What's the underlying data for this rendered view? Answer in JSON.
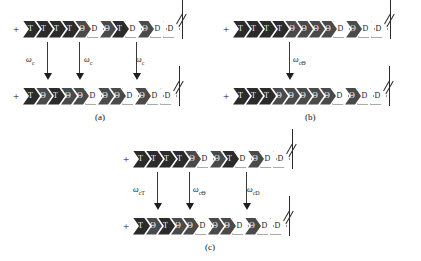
{
  "figure": {
    "symbols": {
      "T": "T",
      "Theta": "Θ",
      "D": "D",
      "plus_end": "+",
      "omega": "ω"
    },
    "panels": [
      {
        "id": "a",
        "caption": "(a)",
        "top_strand": {
          "plus_label": "+",
          "segments": [
            "T",
            "T",
            "T",
            "T",
            "Θ",
            "D",
            "Θ",
            "T",
            "D",
            "Θ",
            "D",
            "D"
          ],
          "states": [
            "T",
            "T",
            "T",
            "T",
            "O",
            "D",
            "O",
            "T",
            "D",
            "O",
            "D",
            "D"
          ]
        },
        "bottom_strand": {
          "plus_label": "+",
          "segments": [
            "T",
            "Θ",
            "T",
            "Θ",
            "Θ",
            "D",
            "Θ",
            "Θ",
            "D",
            "Θ",
            "D",
            "D"
          ],
          "states": [
            "T",
            "O",
            "T",
            "O",
            "O",
            "D",
            "O",
            "O",
            "D",
            "O",
            "D",
            "D"
          ]
        },
        "transitions": [
          {
            "label_base": "ω",
            "label_sub": "c"
          },
          {
            "label_base": "ω",
            "label_sub": "c"
          },
          {
            "label_base": "ω",
            "label_sub": "c"
          }
        ]
      },
      {
        "id": "b",
        "caption": "(b)",
        "top_strand": {
          "plus_label": "+",
          "segments": [
            "T",
            "T",
            "T",
            "T",
            "Θ",
            "Θ",
            "Θ",
            "Θ",
            "D",
            "Θ",
            "D",
            "D"
          ],
          "states": [
            "T",
            "T",
            "T",
            "T",
            "O",
            "O",
            "O",
            "O",
            "D",
            "O",
            "D",
            "D"
          ]
        },
        "bottom_strand": {
          "plus_label": "+",
          "segments": [
            "T",
            "T",
            "T",
            "Θ",
            "Θ",
            "Θ",
            "Θ",
            "Θ",
            "D",
            "Θ",
            "D",
            "D"
          ],
          "states": [
            "T",
            "T",
            "T",
            "O",
            "O",
            "O",
            "O",
            "O",
            "D",
            "O",
            "D",
            "D"
          ]
        },
        "transitions": [
          {
            "label_base": "ω",
            "label_sub": "cΘ"
          }
        ]
      },
      {
        "id": "c",
        "caption": "(c)",
        "top_strand": {
          "plus_label": "+",
          "segments": [
            "T",
            "T",
            "T",
            "T",
            "Θ",
            "D",
            "Θ",
            "T",
            "D",
            "Θ",
            "D",
            "D"
          ],
          "states": [
            "T",
            "T",
            "T",
            "T",
            "O",
            "D",
            "O",
            "T",
            "D",
            "O",
            "D",
            "D"
          ]
        },
        "bottom_strand": {
          "plus_label": "+",
          "segments": [
            "T",
            "Θ",
            "T",
            "Θ",
            "Θ",
            "D",
            "Θ",
            "Θ",
            "D",
            "Θ",
            "D",
            "D"
          ],
          "states": [
            "T",
            "O",
            "T",
            "O",
            "O",
            "D",
            "O",
            "O",
            "D",
            "O",
            "D",
            "D"
          ]
        },
        "transitions": [
          {
            "label_base": "ω",
            "label_sub": "cT"
          },
          {
            "label_base": "ω",
            "label_sub": "cΘ"
          },
          {
            "label_base": "ω",
            "label_sub": "cD"
          }
        ]
      }
    ]
  }
}
